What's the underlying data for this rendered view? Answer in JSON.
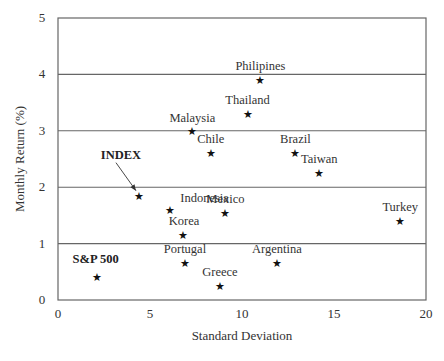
{
  "chart_data": {
    "type": "scatter",
    "title": "",
    "xlabel": "Standard Deviation",
    "ylabel": "Monthly Return (%)",
    "xlim": [
      0,
      20
    ],
    "ylim": [
      0,
      5
    ],
    "x_ticks": [
      "0",
      "5",
      "10",
      "15",
      "20"
    ],
    "y_ticks": [
      "0",
      "1",
      "2",
      "3",
      "4",
      "5"
    ],
    "grid": {
      "horizontal": true,
      "vertical": false
    },
    "marker": "star",
    "points": [
      {
        "label": "Philipines",
        "x": 11.0,
        "y": 3.9,
        "bold": false
      },
      {
        "label": "Thailand",
        "x": 10.3,
        "y": 3.3,
        "bold": false
      },
      {
        "label": "Malaysia",
        "x": 7.3,
        "y": 3.0,
        "bold": false
      },
      {
        "label": "Chile",
        "x": 8.3,
        "y": 2.6,
        "bold": false
      },
      {
        "label": "Brazil",
        "x": 12.9,
        "y": 2.6,
        "bold": false
      },
      {
        "label": "Taiwan",
        "x": 14.2,
        "y": 2.25,
        "bold": false
      },
      {
        "label": "INDEX",
        "x": 4.4,
        "y": 1.85,
        "bold": true
      },
      {
        "label": "Indonesia",
        "x": 6.1,
        "y": 1.6,
        "bold": false
      },
      {
        "label": "Mexico",
        "x": 9.1,
        "y": 1.55,
        "bold": false
      },
      {
        "label": "Turkey",
        "x": 18.6,
        "y": 1.4,
        "bold": false
      },
      {
        "label": "Korea",
        "x": 6.8,
        "y": 1.15,
        "bold": false
      },
      {
        "label": "Portugal",
        "x": 6.9,
        "y": 0.65,
        "bold": false
      },
      {
        "label": "Argentina",
        "x": 11.9,
        "y": 0.65,
        "bold": false
      },
      {
        "label": "S&P 500",
        "x": 2.1,
        "y": 0.4,
        "bold": true
      },
      {
        "label": "Greece",
        "x": 8.8,
        "y": 0.25,
        "bold": false
      }
    ],
    "annotations": [
      {
        "text": "INDEX",
        "type": "arrow",
        "points_to": "INDEX"
      }
    ]
  }
}
